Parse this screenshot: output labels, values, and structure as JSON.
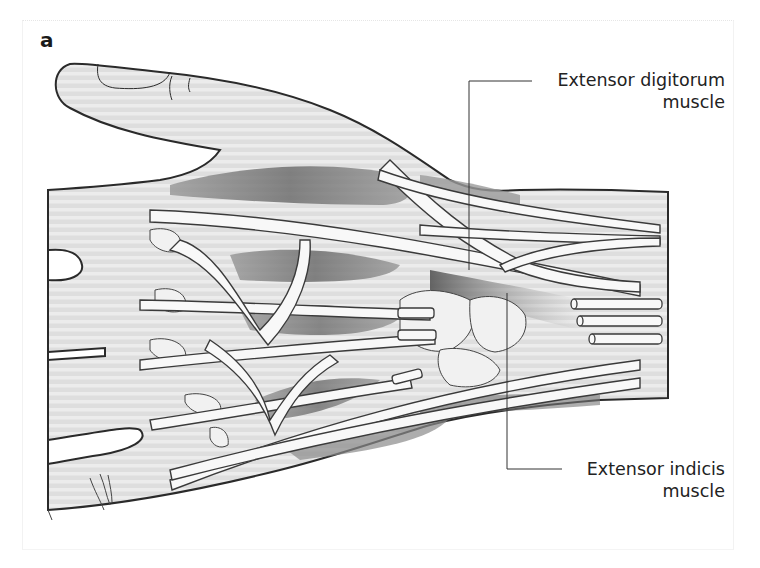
{
  "figure": {
    "panel_label": "a",
    "colors": {
      "skin_fill": "#dcdcdc",
      "skin_stripe": "#ededed",
      "outline": "#2a2a2a",
      "tendon": "#f7f7f7",
      "muscle_dark": "#7a7a7a",
      "muscle_mid": "#a8a8a8",
      "leader_line": "#333333",
      "label_text": "#222222"
    }
  },
  "annotations": [
    {
      "id": "extensor-digitorum",
      "line1": "Extensor digitorum",
      "line2": "muscle",
      "leader": {
        "anchor_x": 469,
        "anchor_y": 270,
        "elbow_x": 469,
        "elbow_y": 81,
        "end_x": 532,
        "end_y": 81
      }
    },
    {
      "id": "extensor-indicis",
      "line1": "Extensor indicis",
      "line2": "muscle",
      "leader": {
        "anchor_x": 507,
        "anchor_y": 293,
        "elbow_x": 507,
        "elbow_y": 469,
        "end_x": 562,
        "end_y": 469
      }
    }
  ]
}
